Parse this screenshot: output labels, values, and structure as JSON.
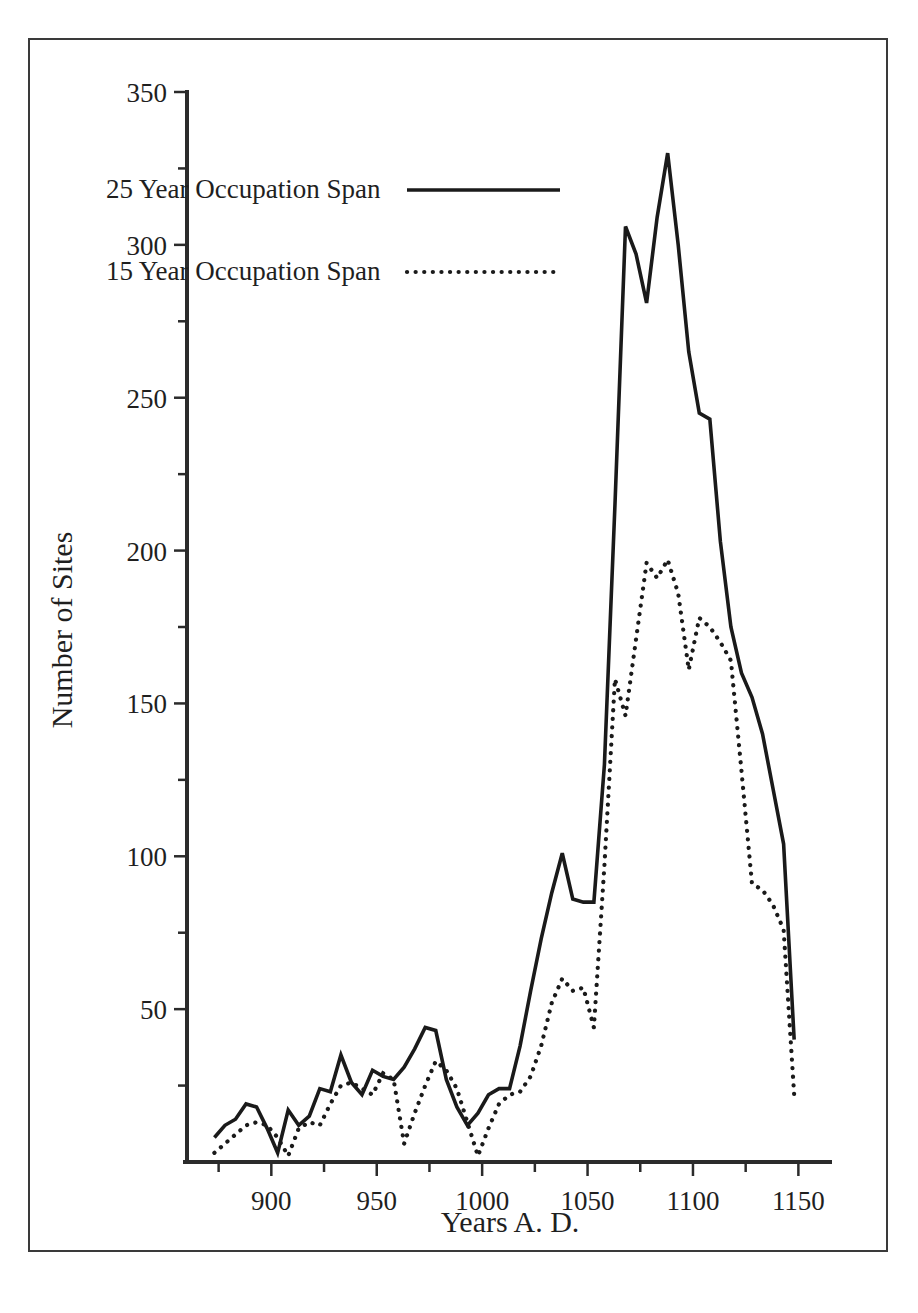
{
  "chart_data": {
    "type": "line",
    "title": "",
    "xlabel": "Years A. D.",
    "ylabel": "Number of Sites",
    "xlim": [
      860,
      1165
    ],
    "ylim": [
      0,
      350
    ],
    "xticks": [
      900,
      950,
      1000,
      1050,
      1100,
      1150
    ],
    "yticks": [
      50,
      100,
      150,
      200,
      250,
      300,
      350
    ],
    "xtick_labels": [
      "900",
      "950",
      "1000",
      "1050",
      "1100",
      "1150"
    ],
    "ytick_labels": [
      "50",
      "100",
      "150",
      "200",
      "250",
      "300",
      "350"
    ],
    "x_minor_step": 25,
    "y_minor_step": 25,
    "grid": false,
    "legend_position": "upper-left",
    "x": [
      873,
      878,
      883,
      888,
      893,
      898,
      903,
      908,
      913,
      918,
      923,
      928,
      933,
      938,
      943,
      948,
      953,
      958,
      963,
      968,
      973,
      978,
      983,
      988,
      993,
      998,
      1003,
      1008,
      1013,
      1018,
      1023,
      1028,
      1033,
      1038,
      1043,
      1048,
      1053,
      1058,
      1063,
      1068,
      1073,
      1078,
      1083,
      1088,
      1093,
      1098,
      1103,
      1108,
      1113,
      1118,
      1123,
      1128,
      1133,
      1138,
      1143,
      1148
    ],
    "series": [
      {
        "name": "25 Year Occupation Span",
        "style": "solid",
        "values": [
          8,
          12,
          14,
          19,
          18,
          11,
          3,
          17,
          12,
          15,
          24,
          23,
          35,
          26,
          22,
          30,
          28,
          27,
          31,
          37,
          44,
          43,
          27,
          18,
          12,
          16,
          22,
          24,
          24,
          38,
          56,
          73,
          88,
          101,
          86,
          85,
          85,
          130,
          215,
          306,
          297,
          281,
          309,
          330,
          300,
          265,
          245,
          243,
          203,
          175,
          160,
          152,
          140,
          122,
          104,
          40
        ]
      },
      {
        "name": "15 Year Occupation Span",
        "style": "dotted",
        "values": [
          3,
          6,
          9,
          12,
          13,
          12,
          8,
          2,
          11,
          13,
          12,
          19,
          25,
          26,
          24,
          22,
          29,
          27,
          6,
          16,
          25,
          33,
          30,
          24,
          13,
          2,
          11,
          19,
          22,
          23,
          28,
          38,
          52,
          60,
          56,
          57,
          44,
          97,
          158,
          146,
          171,
          196,
          191,
          197,
          186,
          161,
          178,
          175,
          170,
          164,
          128,
          91,
          89,
          84,
          76,
          22
        ]
      }
    ],
    "legend": [
      {
        "label": "25 Year Occupation Span",
        "style": "solid"
      },
      {
        "label": "15 Year Occupation Span",
        "style": "dotted"
      }
    ]
  }
}
